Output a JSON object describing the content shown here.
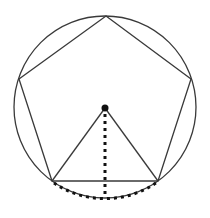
{
  "diagram": {
    "title": "Regular pentagon inscribed in a circle",
    "colors": {
      "stroke": "#3a3a3a",
      "dots": "#111111",
      "background": "#ffffff"
    },
    "circle": {
      "cx": 105,
      "cy": 107,
      "r": 91
    },
    "center": {
      "x": 105,
      "y": 108,
      "r": 3.5
    },
    "pentagon": [
      {
        "x": 106,
        "y": 16
      },
      {
        "x": 191,
        "y": 79
      },
      {
        "x": 158,
        "y": 181
      },
      {
        "x": 52,
        "y": 181
      },
      {
        "x": 19,
        "y": 79
      }
    ],
    "apothem_foot": {
      "x": 105,
      "y": 198
    }
  }
}
